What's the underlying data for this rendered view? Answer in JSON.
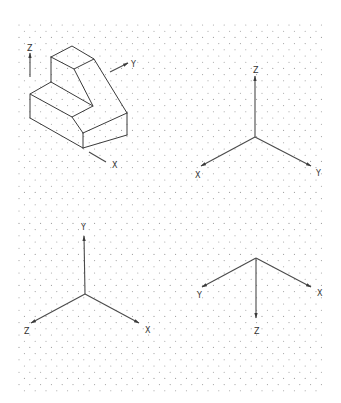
{
  "figure": {
    "colors": {
      "background": "#ffffff",
      "ink": "#3a3a3a",
      "grid_dot": "#9a9a9a"
    }
  },
  "grid": {
    "type": "isometric-dots",
    "x_start": 19,
    "x_end": 326,
    "y_start": 25,
    "y_end": 392,
    "col_spacing": 10.8,
    "row_spacing": 6.2
  },
  "panels": [
    {
      "id": "solid",
      "title": "Isometric solid with reference axes",
      "axes": [
        {
          "label": "Z",
          "from": [
            30,
            77
          ],
          "to": [
            30,
            53
          ],
          "label_pos": [
            27,
            50
          ]
        },
        {
          "label": "Y",
          "from": [
            110,
            72
          ],
          "to": [
            128,
            63
          ],
          "label_pos": [
            131,
            66
          ]
        },
        {
          "label": "X",
          "from": [
            89,
            152
          ],
          "to": [
            106,
            162
          ],
          "label_pos": [
            112,
            167
          ]
        }
      ]
    },
    {
      "id": "axes-1",
      "origin": [
        255,
        137
      ],
      "axes": [
        {
          "label": "Z",
          "to": [
            255,
            76
          ],
          "label_pos": [
            253,
            72
          ]
        },
        {
          "label": "X",
          "to": [
            201,
            166
          ],
          "label_pos": [
            195,
            177
          ]
        },
        {
          "label": "Y",
          "to": [
            311,
            166
          ],
          "label_pos": [
            316,
            175
          ]
        }
      ]
    },
    {
      "id": "axes-2",
      "origin": [
        85,
        294
      ],
      "axes": [
        {
          "label": "Y",
          "to": [
            84,
            236
          ],
          "label_pos": [
            81,
            229
          ]
        },
        {
          "label": "Z",
          "to": [
            31,
            323
          ],
          "label_pos": [
            24,
            333
          ]
        },
        {
          "label": "X",
          "to": [
            139,
            323
          ],
          "label_pos": [
            145,
            332
          ]
        }
      ]
    },
    {
      "id": "axes-3",
      "origin": [
        256,
        258
      ],
      "axes": [
        {
          "label": "Y",
          "to": [
            202,
            287
          ],
          "label_pos": [
            197,
            297
          ]
        },
        {
          "label": "X",
          "to": [
            311,
            287
          ],
          "label_pos": [
            317,
            295
          ]
        },
        {
          "label": "Z",
          "to": [
            256,
            318
          ],
          "label_pos": [
            254,
            333
          ]
        }
      ]
    }
  ],
  "labels": {
    "solid_z": "Z",
    "solid_y": "Y",
    "solid_x": "X",
    "a1_z": "Z",
    "a1_x": "X",
    "a1_y": "Y",
    "a2_y": "Y",
    "a2_z": "Z",
    "a2_x": "X",
    "a3_y": "Y",
    "a3_x": "X",
    "a3_z": "Z"
  }
}
